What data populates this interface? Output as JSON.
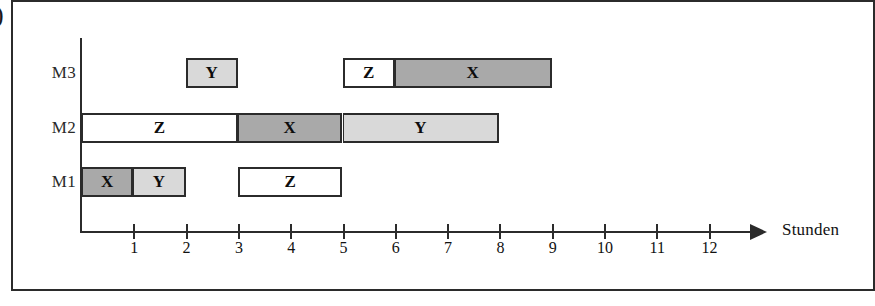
{
  "figure": {
    "edge_glyph": ")",
    "axis_title": "Stunden"
  },
  "rows": [
    {
      "label": "M3"
    },
    {
      "label": "M2"
    },
    {
      "label": "M1"
    }
  ],
  "axis": {
    "ticks": [
      {
        "label": "1",
        "value": 1
      },
      {
        "label": "2",
        "value": 2
      },
      {
        "label": "3",
        "value": 3
      },
      {
        "label": "4",
        "value": 4
      },
      {
        "label": "5",
        "value": 5
      },
      {
        "label": "6",
        "value": 6
      },
      {
        "label": "7",
        "value": 7
      },
      {
        "label": "8",
        "value": 8
      },
      {
        "label": "9",
        "value": 9
      },
      {
        "label": "10",
        "value": 10
      },
      {
        "label": "11",
        "value": 11
      },
      {
        "label": "12",
        "value": 12
      }
    ]
  },
  "bars": [
    {
      "row": "M3",
      "label": "Y",
      "start": 2,
      "end": 3,
      "fill": "light",
      "join_left": false
    },
    {
      "row": "M3",
      "label": "Z",
      "start": 5,
      "end": 6,
      "fill": "white",
      "join_left": false
    },
    {
      "row": "M3",
      "label": "X",
      "start": 6,
      "end": 9,
      "fill": "dark",
      "join_left": true
    },
    {
      "row": "M2",
      "label": "Z",
      "start": 0,
      "end": 3,
      "fill": "white",
      "join_left": false
    },
    {
      "row": "M2",
      "label": "X",
      "start": 3,
      "end": 5,
      "fill": "dark",
      "join_left": true
    },
    {
      "row": "M2",
      "label": "Y",
      "start": 5,
      "end": 8,
      "fill": "light",
      "join_left": true
    },
    {
      "row": "M1",
      "label": "X",
      "start": 0,
      "end": 1,
      "fill": "dark",
      "join_left": false
    },
    {
      "row": "M1",
      "label": "Y",
      "start": 1,
      "end": 2,
      "fill": "light",
      "join_left": true
    },
    {
      "row": "M1",
      "label": "Z",
      "start": 3,
      "end": 5,
      "fill": "white",
      "join_left": false
    }
  ],
  "colors": {
    "dark": "#a9a9a9",
    "light": "#d9d9d9",
    "white": "#ffffff",
    "stroke": "#2b2b2b"
  },
  "chart_data": {
    "type": "bar",
    "title": "",
    "xlabel": "Stunden",
    "ylabel": "",
    "xlim": [
      0,
      12.8
    ],
    "grid": false,
    "legend": "none",
    "categories": [
      "M1",
      "M2",
      "M3"
    ],
    "series": [
      {
        "name": "X",
        "fill": "dark",
        "intervals": [
          {
            "row": "M1",
            "start": 0,
            "end": 1,
            "duration": 1
          },
          {
            "row": "M2",
            "start": 3,
            "end": 5,
            "duration": 2
          },
          {
            "row": "M3",
            "start": 6,
            "end": 9,
            "duration": 3
          }
        ]
      },
      {
        "name": "Y",
        "fill": "light",
        "intervals": [
          {
            "row": "M1",
            "start": 1,
            "end": 2,
            "duration": 1
          },
          {
            "row": "M2",
            "start": 5,
            "end": 8,
            "duration": 3
          },
          {
            "row": "M3",
            "start": 2,
            "end": 3,
            "duration": 1
          }
        ]
      },
      {
        "name": "Z",
        "fill": "white",
        "intervals": [
          {
            "row": "M1",
            "start": 3,
            "end": 5,
            "duration": 2
          },
          {
            "row": "M2",
            "start": 0,
            "end": 3,
            "duration": 3
          },
          {
            "row": "M3",
            "start": 5,
            "end": 6,
            "duration": 1
          }
        ]
      }
    ],
    "xticks": [
      1,
      2,
      3,
      4,
      5,
      6,
      7,
      8,
      9,
      10,
      11,
      12
    ],
    "makespan": 9
  }
}
